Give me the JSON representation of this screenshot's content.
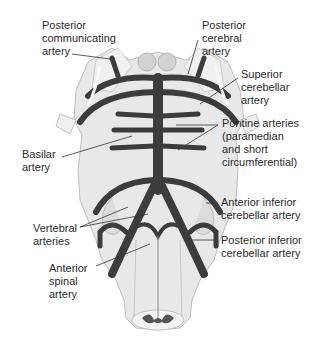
{
  "diagram": {
    "colors": {
      "artery": "#3c3c3c",
      "artery_highlight": "#5a5a5a",
      "tissue": "#e6e6e6",
      "tissue_outline": "#bdbdbd",
      "leader_line": "#333333",
      "text": "#2b2b2b"
    },
    "labels": [
      {
        "id": "pcomm",
        "lines": [
          "Posterior",
          "communicating",
          "artery"
        ]
      },
      {
        "id": "pca",
        "lines": [
          "Posterior",
          "cerebral",
          "artery"
        ]
      },
      {
        "id": "sca",
        "lines": [
          "Superior",
          "cerebellar",
          "artery"
        ]
      },
      {
        "id": "pontine",
        "lines": [
          "Pontine arteries",
          "(paramedian",
          "and short",
          "circumferential)"
        ]
      },
      {
        "id": "basilar",
        "lines": [
          "Basilar",
          "artery"
        ]
      },
      {
        "id": "aica",
        "lines": [
          "Anterior inferior",
          "cerebellar artery"
        ]
      },
      {
        "id": "vertebral",
        "lines": [
          "Vertebral",
          "arteries"
        ]
      },
      {
        "id": "pica",
        "lines": [
          "Posterior inferior",
          "cerebellar artery"
        ]
      },
      {
        "id": "asa",
        "lines": [
          "Anterior",
          "spinal",
          "artery"
        ]
      }
    ]
  }
}
